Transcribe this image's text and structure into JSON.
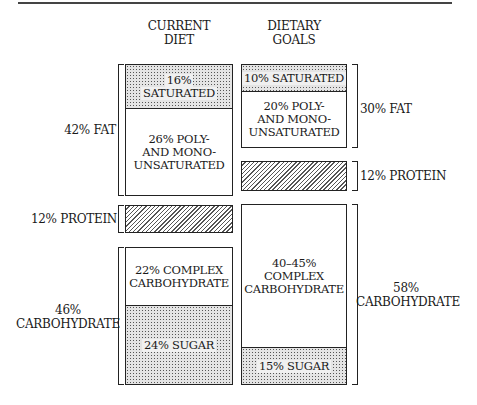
{
  "columns": {
    "current": {
      "title_line1": "CURRENT",
      "title_line2": "DIET"
    },
    "goals": {
      "title_line1": "DIETARY",
      "title_line2": "GOALS"
    }
  },
  "current": {
    "saturated": {
      "l1": "16%",
      "l2": "SATURATED"
    },
    "unsaturated": {
      "l1": "26% POLY-",
      "l2": "AND MONO-",
      "l3": "UNSATURATED"
    },
    "complex": {
      "l1": "22% COMPLEX",
      "l2": "CARBOHYDRATE"
    },
    "sugar": "24% SUGAR",
    "fat_label": "42% FAT",
    "protein_label": "12% PROTEIN",
    "carb_label_l1": "46%",
    "carb_label_l2": "CARBOHYDRATE"
  },
  "goals": {
    "saturated": "10% SATURATED",
    "unsaturated": {
      "l1": "20% POLY-",
      "l2": "AND MONO-",
      "l3": "UNSATURATED"
    },
    "complex": {
      "l1": "40–45%",
      "l2": "COMPLEX",
      "l3": "CARBOHYDRATE"
    },
    "sugar": "15% SUGAR",
    "fat_label": "30% FAT",
    "protein_label": "12% PROTEIN",
    "carb_label_l1": "58%",
    "carb_label_l2": "CARBOHYDRATE"
  },
  "patterns": {
    "stipple": "saturated fat / sugar",
    "hatch": "protein"
  }
}
